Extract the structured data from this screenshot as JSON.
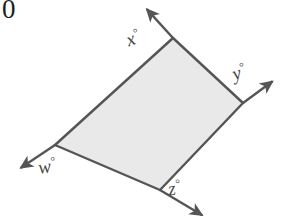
{
  "figure": {
    "problem_number": "0",
    "background_color": "#ffffff",
    "shape": {
      "name": "quadrilateral",
      "fill_color": "#e9e9e9",
      "stroke_color": "#555555",
      "stroke_width": 2.4,
      "vertices": [
        {
          "name": "top",
          "x": 173,
          "y": 38
        },
        {
          "name": "right",
          "x": 243,
          "y": 103
        },
        {
          "name": "bottom",
          "x": 160,
          "y": 190
        },
        {
          "name": "left",
          "x": 55,
          "y": 145
        }
      ]
    },
    "rays": [
      {
        "name": "ray-top-left",
        "from_vertex": "top",
        "tip_x": 143,
        "tip_y": 5,
        "label": "x"
      },
      {
        "name": "ray-right",
        "from_vertex": "right",
        "tip_x": 277,
        "tip_y": 78,
        "label": "y"
      },
      {
        "name": "ray-bottom-right",
        "from_vertex": "bottom",
        "tip_x": 207,
        "tip_y": 218,
        "label": "z"
      },
      {
        "name": "ray-left",
        "from_vertex": "left",
        "tip_x": 16,
        "tip_y": 171,
        "label": "w"
      }
    ],
    "labels": {
      "x": {
        "variable": "x",
        "degree_symbol": "°"
      },
      "y": {
        "variable": "y",
        "degree_symbol": "°"
      },
      "z": {
        "variable": "z",
        "degree_symbol": "°"
      },
      "w": {
        "variable": "w",
        "degree_symbol": "°"
      }
    },
    "label_color": "#4a4a4a"
  }
}
